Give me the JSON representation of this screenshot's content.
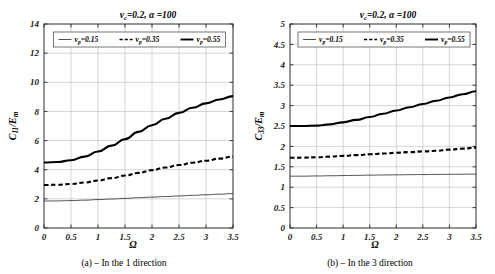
{
  "figure": {
    "panels": [
      {
        "id": "a",
        "title": "v_c=0.2,  α =100",
        "title_parts": {
          "var": "v",
          "sub": "c",
          "eq": "=0.2,",
          "alpha": "α =100"
        },
        "caption": "(a) – In the 1 direction",
        "ylabel": "C₁₁/Eₘ",
        "ylabel_parts": {
          "main": "C",
          "sub": "11",
          "div": "/E",
          "sub2": "m"
        },
        "xlabel": "Ω",
        "legend": [
          {
            "label": "v_p = 0.15",
            "style": "thin",
            "label_parts": {
              "var": "v",
              "sub": "p",
              "val": "=0.15"
            }
          },
          {
            "label": "v_p = 0.35",
            "style": "dashed",
            "label_parts": {
              "var": "v",
              "sub": "p",
              "val": "=0.35"
            }
          },
          {
            "label": "v_p = 0.55",
            "style": "thick",
            "label_parts": {
              "var": "v",
              "sub": "p",
              "val": "=0.55"
            }
          }
        ]
      },
      {
        "id": "b",
        "title": "v_c=0.2,  α =100",
        "title_parts": {
          "var": "v",
          "sub": "c",
          "eq": "=0.2,",
          "alpha": "α =100"
        },
        "caption": "(b) – In the 3 direction",
        "ylabel": "C₃₃/Eₘ",
        "ylabel_parts": {
          "main": "C",
          "sub": "33",
          "div": "/E",
          "sub2": "m"
        },
        "xlabel": "Ω",
        "legend": [
          {
            "label": "v_p = 0.15",
            "style": "thin",
            "label_parts": {
              "var": "v",
              "sub": "p",
              "val": "=0.15"
            }
          },
          {
            "label": "v_p = 0.35",
            "style": "dashed",
            "label_parts": {
              "var": "v",
              "sub": "p",
              "val": "=0.35"
            }
          },
          {
            "label": "v_p = 0.55",
            "style": "thick",
            "label_parts": {
              "var": "v",
              "sub": "p",
              "val": "=0.55"
            }
          }
        ]
      }
    ]
  },
  "chart_data": [
    {
      "type": "line",
      "panel": "a",
      "title": "v_c=0.2, α=100",
      "xlabel": "Ω",
      "ylabel": "C_11/E_m",
      "xlim": [
        0,
        3.5
      ],
      "ylim": [
        0,
        14
      ],
      "xticks": [
        0,
        0.5,
        1,
        1.5,
        2,
        2.5,
        3,
        3.5
      ],
      "xtick_labels": [
        "0",
        "0.5",
        "1",
        "1.5",
        "2",
        "2.5",
        "3",
        "3.5"
      ],
      "yticks": [
        0,
        2,
        4,
        6,
        8,
        10,
        12,
        14
      ],
      "ytick_labels": [
        "0",
        "2",
        "4",
        "6",
        "8",
        "10",
        "12",
        "14"
      ],
      "grid": true,
      "legend_position": "upper-center",
      "x": [
        0,
        0.25,
        0.5,
        0.75,
        1,
        1.25,
        1.5,
        1.75,
        2,
        2.25,
        2.5,
        2.75,
        3,
        3.25,
        3.5
      ],
      "series": [
        {
          "name": "v_p = 0.15",
          "style": "thin",
          "values": [
            1.85,
            1.86,
            1.88,
            1.91,
            1.95,
            1.99,
            2.03,
            2.08,
            2.12,
            2.16,
            2.2,
            2.24,
            2.28,
            2.32,
            2.36
          ]
        },
        {
          "name": "v_p = 0.35",
          "style": "dashed",
          "values": [
            2.95,
            2.97,
            3.02,
            3.12,
            3.26,
            3.42,
            3.6,
            3.78,
            3.97,
            4.15,
            4.32,
            4.48,
            4.62,
            4.76,
            4.9
          ]
        },
        {
          "name": "v_p = 0.55",
          "style": "thick",
          "values": [
            4.5,
            4.53,
            4.65,
            4.9,
            5.25,
            5.65,
            6.1,
            6.6,
            7.05,
            7.5,
            7.9,
            8.25,
            8.55,
            8.82,
            9.05
          ]
        }
      ]
    },
    {
      "type": "line",
      "panel": "b",
      "title": "v_c=0.2, α=100",
      "xlabel": "Ω",
      "ylabel": "C_33/E_m",
      "xlim": [
        0,
        3.5
      ],
      "ylim": [
        0,
        5
      ],
      "xticks": [
        0,
        0.5,
        1,
        1.5,
        2,
        2.5,
        3,
        3.5
      ],
      "xtick_labels": [
        "0",
        "0.5",
        "1",
        "1.5",
        "2",
        "2.5",
        "3",
        "3.5"
      ],
      "yticks": [
        0,
        0.5,
        1,
        1.5,
        2,
        2.5,
        3,
        3.5,
        4,
        4.5,
        5
      ],
      "ytick_labels": [
        "0",
        "0.5",
        "1",
        "1.5",
        "2",
        "2.5",
        "3",
        "3.5",
        "4",
        "4.5",
        "5"
      ],
      "grid": true,
      "legend_position": "upper-center",
      "x": [
        0,
        0.25,
        0.5,
        0.75,
        1,
        1.25,
        1.5,
        1.75,
        2,
        2.25,
        2.5,
        2.75,
        3,
        3.25,
        3.5
      ],
      "series": [
        {
          "name": "v_p = 0.15",
          "style": "thin",
          "values": [
            1.27,
            1.27,
            1.275,
            1.28,
            1.285,
            1.29,
            1.295,
            1.3,
            1.303,
            1.307,
            1.31,
            1.313,
            1.316,
            1.318,
            1.32
          ]
        },
        {
          "name": "v_p = 0.35",
          "style": "dashed",
          "values": [
            1.72,
            1.725,
            1.735,
            1.75,
            1.768,
            1.787,
            1.806,
            1.825,
            1.843,
            1.86,
            1.877,
            1.892,
            1.92,
            1.945,
            1.97
          ]
        },
        {
          "name": "v_p = 0.55",
          "style": "thick",
          "values": [
            2.5,
            2.5,
            2.51,
            2.54,
            2.59,
            2.65,
            2.72,
            2.8,
            2.88,
            2.96,
            3.04,
            3.12,
            3.2,
            3.28,
            3.35
          ]
        }
      ]
    }
  ]
}
